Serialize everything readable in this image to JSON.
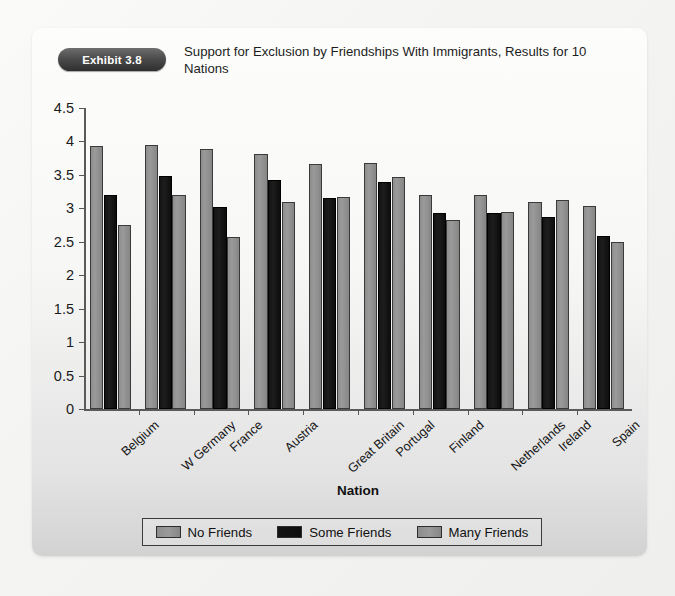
{
  "exhibit": {
    "badge_label": "Exhibit 3.8",
    "title": "Support for Exclusion by Friendships With Immigrants, Results for 10 Nations"
  },
  "chart_data": {
    "type": "bar",
    "title": "Support for Exclusion by Friendships With Immigrants, Results for 10 Nations",
    "xlabel": "Nation",
    "ylabel": "",
    "ylim": [
      0,
      4.5
    ],
    "ytick_labels": [
      "0",
      "0.5",
      "1",
      "1.5",
      "2",
      "2.5",
      "3",
      "3.5",
      "4",
      "4.5"
    ],
    "ytick_values": [
      0,
      0.5,
      1,
      1.5,
      2,
      2.5,
      3,
      3.5,
      4,
      4.5
    ],
    "grid": false,
    "legend_position": "bottom",
    "categories": [
      "Belgium",
      "W Germany",
      "France",
      "Austria",
      "Great Britain",
      "Portugal",
      "Finland",
      "Netherlands",
      "Ireland",
      "Spain"
    ],
    "series": [
      {
        "name": "No Friends",
        "color": "#8d8d8d",
        "values": [
          3.93,
          3.94,
          3.89,
          3.81,
          3.67,
          3.68,
          3.2,
          3.2,
          3.1,
          3.04
        ]
      },
      {
        "name": "Some Friends",
        "color": "#141414",
        "values": [
          3.2,
          3.48,
          3.02,
          3.43,
          3.15,
          3.4,
          2.93,
          2.93,
          2.87,
          2.59
        ]
      },
      {
        "name": "Many Friends",
        "color": "#8d8d8d",
        "values": [
          2.75,
          3.2,
          2.57,
          3.1,
          3.17,
          3.47,
          2.82,
          2.94,
          3.12,
          2.49
        ]
      }
    ]
  },
  "legend": {
    "items": [
      {
        "label": "No Friends",
        "color": "#8d8d8d"
      },
      {
        "label": "Some Friends",
        "color": "#141414"
      },
      {
        "label": "Many Friends",
        "color": "#8d8d8d"
      }
    ]
  }
}
